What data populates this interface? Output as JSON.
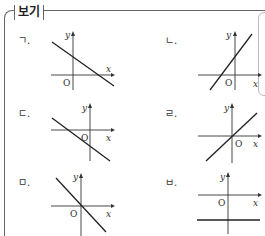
{
  "box": {
    "title": "보기"
  },
  "axis_labels": {
    "x": "x",
    "y": "y",
    "origin": "O"
  },
  "graphs": [
    {
      "label": "ㄱ.",
      "description": "line with negative slope, positive y-intercept, positive x-intercept"
    },
    {
      "label": "ㄴ.",
      "description": "line with positive slope, positive y-intercept, negative x-intercept"
    },
    {
      "label": "ㄷ.",
      "description": "line with negative slope, negative y-intercept, negative x-intercept"
    },
    {
      "label": "ㄹ.",
      "description": "line with positive slope through the origin"
    },
    {
      "label": "ㅁ.",
      "description": "line with negative slope through the origin"
    },
    {
      "label": "ㅂ.",
      "description": "horizontal line below the x-axis (negative constant)"
    }
  ]
}
